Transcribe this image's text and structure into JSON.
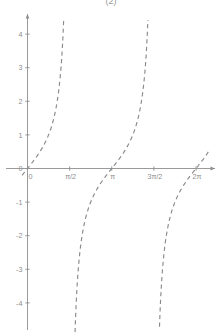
{
  "figure": {
    "caption": "(2)",
    "background_color": "#ffffff",
    "curve_color": "#8a8a8a",
    "axis_color": "#8e8e8e",
    "label_color": "#8d8d8d"
  },
  "chart_data": {
    "type": "line",
    "title": "(2)",
    "subtitle": "",
    "xlabel": "",
    "ylabel": "",
    "function": "y = tan(x)",
    "grid": false,
    "legend": "none",
    "line_style": "dashed",
    "xlim": [
      -0.2,
      6.8
    ],
    "ylim": [
      -4.85,
      4.7
    ],
    "x_ticks": [
      {
        "value": 0,
        "label": "0"
      },
      {
        "value": 1.5707963,
        "label": "π/2"
      },
      {
        "value": 3.1415927,
        "label": "π"
      },
      {
        "value": 4.712389,
        "label": "3π/2"
      },
      {
        "value": 6.2831853,
        "label": "2π"
      }
    ],
    "y_ticks": [
      {
        "value": 4,
        "label": "4"
      },
      {
        "value": 3,
        "label": "3"
      },
      {
        "value": 2,
        "label": "2"
      },
      {
        "value": 1,
        "label": "1"
      },
      {
        "value": 0,
        "label": "0"
      },
      {
        "value": -1,
        "label": "-1"
      },
      {
        "value": -2,
        "label": "-2"
      },
      {
        "value": -3,
        "label": "-3"
      },
      {
        "value": -4,
        "label": "-4"
      }
    ],
    "asymptotes": [
      1.5707963,
      4.712389
    ],
    "series": [
      {
        "name": "tan(x) branch 1",
        "x": [
          -0.2,
          -0.1,
          0.0,
          0.1,
          0.2,
          0.3,
          0.4,
          0.5,
          0.6,
          0.7,
          0.8,
          0.9,
          1.0,
          1.1,
          1.2,
          1.3,
          1.35,
          1.4,
          1.45,
          1.5,
          1.52
        ],
        "y": [
          -0.2027,
          -0.1003,
          0.0,
          0.1003,
          0.2027,
          0.3093,
          0.4228,
          0.5463,
          0.6841,
          0.8423,
          1.0296,
          1.2602,
          1.5574,
          1.9648,
          2.5722,
          3.6021,
          4.4552,
          5.7979,
          8.2381,
          14.101,
          19.67
        ]
      },
      {
        "name": "tan(x) branch 2",
        "x": [
          1.62,
          1.64,
          1.69,
          1.74,
          1.79,
          1.84,
          1.94,
          2.04,
          2.14,
          2.24,
          2.34,
          2.44,
          2.54,
          2.64,
          2.74,
          2.84,
          2.94,
          3.04,
          3.1416,
          3.24,
          3.34,
          3.44,
          3.54,
          3.64,
          3.74,
          3.84,
          3.94,
          4.04,
          4.14,
          4.24,
          4.34,
          4.44,
          4.54,
          4.6,
          4.64,
          4.66
        ],
        "y": [
          -19.67,
          -14.43,
          -8.18,
          -5.67,
          -4.34,
          -3.51,
          -2.47,
          -1.9,
          -1.52,
          -1.25,
          -1.03,
          -0.855,
          -0.699,
          -0.557,
          -0.424,
          -0.295,
          -0.169,
          -0.044,
          0.0,
          0.099,
          0.2,
          0.303,
          0.412,
          0.528,
          0.656,
          0.8,
          0.969,
          1.175,
          1.437,
          1.792,
          2.315,
          3.19,
          5.027,
          7.696,
          12.35,
          16.43
        ]
      },
      {
        "name": "tan(x) branch 3",
        "x": [
          4.76,
          4.78,
          4.83,
          4.88,
          4.93,
          5.03,
          5.13,
          5.23,
          5.33,
          5.43,
          5.53,
          5.63,
          5.73,
          5.83,
          5.93,
          6.03,
          6.13,
          6.23,
          6.2832,
          6.38,
          6.48,
          6.58,
          6.68,
          6.78
        ],
        "y": [
          -20.62,
          -15.13,
          -8.53,
          -5.89,
          -4.5,
          -3.03,
          -2.28,
          -1.8,
          -1.47,
          -1.21,
          -1.0,
          -0.829,
          -0.677,
          -0.538,
          -0.407,
          -0.28,
          -0.155,
          -0.031,
          0.0,
          0.099,
          0.2,
          0.303,
          0.412,
          0.528
        ]
      }
    ]
  }
}
